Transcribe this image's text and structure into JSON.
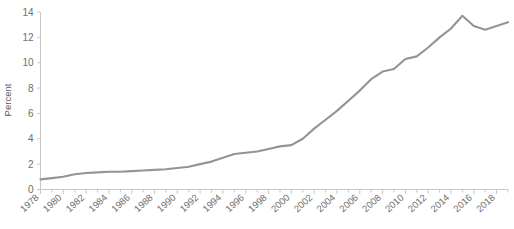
{
  "chart_data": {
    "type": "line",
    "title": "",
    "subtitle": "",
    "xlabel": "",
    "ylabel": "Percent",
    "xlim": [
      1978,
      2019
    ],
    "ylim": [
      0,
      14
    ],
    "grid": false,
    "legend": "none",
    "y_ticks": [
      0,
      2,
      4,
      6,
      8,
      10,
      12,
      14
    ],
    "x_ticks": [
      1978,
      1980,
      1982,
      1984,
      1986,
      1988,
      1990,
      1992,
      1994,
      1996,
      1998,
      2000,
      2002,
      2004,
      2006,
      2008,
      2010,
      2012,
      2014,
      2016,
      2018
    ],
    "x_tick_interval": 2,
    "x_minor_tick_interval": 1,
    "series": [
      {
        "name": "Percent",
        "color": "#949494",
        "x": [
          1978,
          1979,
          1980,
          1981,
          1982,
          1983,
          1984,
          1985,
          1986,
          1987,
          1988,
          1989,
          1990,
          1991,
          1992,
          1993,
          1994,
          1995,
          1996,
          1997,
          1998,
          1999,
          2000,
          2001,
          2002,
          2003,
          2004,
          2005,
          2006,
          2007,
          2008,
          2009,
          2010,
          2011,
          2012,
          2013,
          2014,
          2015,
          2016,
          2017,
          2018,
          2019
        ],
        "values": [
          0.8,
          0.9,
          1.0,
          1.2,
          1.3,
          1.35,
          1.4,
          1.4,
          1.45,
          1.5,
          1.55,
          1.6,
          1.7,
          1.8,
          2.0,
          2.2,
          2.5,
          2.8,
          2.9,
          3.0,
          3.2,
          3.4,
          3.5,
          4.0,
          4.8,
          5.5,
          6.2,
          7.0,
          7.8,
          8.7,
          9.3,
          9.5,
          10.3,
          10.5,
          11.2,
          12.0,
          12.7,
          13.7,
          12.9,
          12.6,
          12.9,
          13.2
        ]
      }
    ]
  },
  "axis": {
    "y_label": "Percent",
    "y_tick_labels": [
      "0",
      "2",
      "4",
      "6",
      "8",
      "10",
      "12",
      "14"
    ],
    "x_tick_labels": [
      "1978",
      "1980",
      "1982",
      "1984",
      "1986",
      "1988",
      "1990",
      "1992",
      "1994",
      "1996",
      "1998",
      "2000",
      "2002",
      "2004",
      "2006",
      "2008",
      "2010",
      "2012",
      "2014",
      "2016",
      "2018"
    ]
  },
  "colors": {
    "line": "#949494",
    "axis": "#c8c8c8",
    "tick_text": "#6e6e6e",
    "axis_label": "#595959",
    "background": "#ffffff"
  }
}
